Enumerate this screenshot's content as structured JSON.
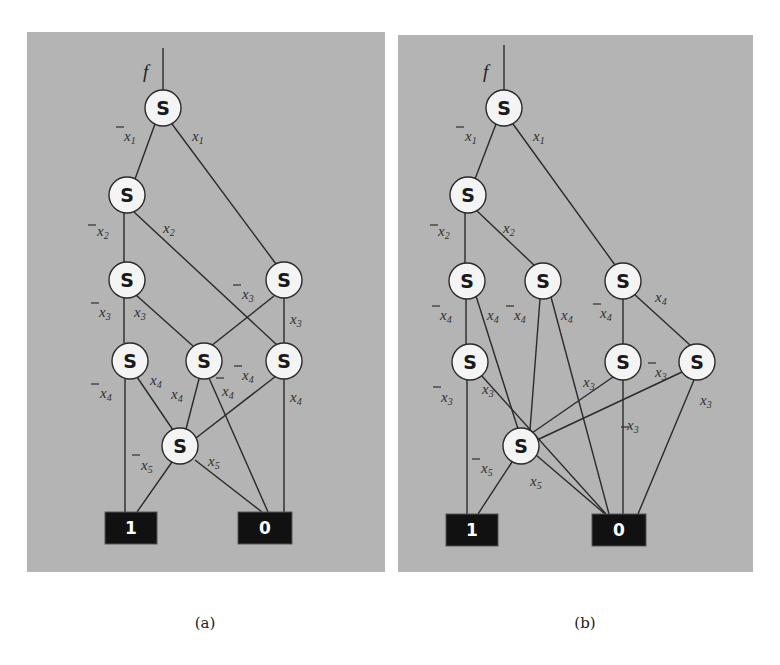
{
  "figure": {
    "node_symbol": "S",
    "root_label": "f",
    "terminal_labels": {
      "one": "1",
      "zero": "0"
    },
    "colors": {
      "panel_background": "#b4b4b4",
      "node_fill": "#f4f4f4",
      "terminal_fill": "#111111",
      "edge": "#2a2a2a"
    }
  },
  "panels": [
    {
      "caption": "(a)",
      "nodes": [
        {
          "id": "a1",
          "level": "x1",
          "label": "S"
        },
        {
          "id": "a2",
          "level": "x2",
          "label": "S"
        },
        {
          "id": "a3",
          "level": "x3",
          "label": "S"
        },
        {
          "id": "a4",
          "level": "x3",
          "label": "S"
        },
        {
          "id": "a5",
          "level": "x4",
          "label": "S"
        },
        {
          "id": "a6",
          "level": "x4",
          "label": "S"
        },
        {
          "id": "a7",
          "level": "x4",
          "label": "S"
        },
        {
          "id": "a8",
          "level": "x5",
          "label": "S"
        }
      ],
      "edges": [
        {
          "from": "a1",
          "to": "a2",
          "label": "x1",
          "negated": true
        },
        {
          "from": "a1",
          "to": "a4",
          "label": "x1",
          "negated": false
        },
        {
          "from": "a2",
          "to": "a3",
          "label": "x2",
          "negated": true
        },
        {
          "from": "a2",
          "to": "a7",
          "label": "x2",
          "negated": false
        },
        {
          "from": "a3",
          "to": "a5",
          "label": "x3",
          "negated": true
        },
        {
          "from": "a3",
          "to": "a6",
          "label": "x3",
          "negated": false
        },
        {
          "from": "a4",
          "to": "a6",
          "label": "x3",
          "negated": true
        },
        {
          "from": "a4",
          "to": "a7",
          "label": "x3",
          "negated": false
        },
        {
          "from": "a5",
          "to": "1",
          "label": "x4",
          "negated": true
        },
        {
          "from": "a5",
          "to": "a8",
          "label": "x4",
          "negated": false
        },
        {
          "from": "a6",
          "to": "a8",
          "label": "x4",
          "negated": false
        },
        {
          "from": "a6",
          "to": "0",
          "label": "x4",
          "negated": true
        },
        {
          "from": "a7",
          "to": "a8",
          "label": "x4",
          "negated": true
        },
        {
          "from": "a7",
          "to": "0",
          "label": "x4",
          "negated": false
        },
        {
          "from": "a8",
          "to": "1",
          "label": "x5",
          "negated": true
        },
        {
          "from": "a8",
          "to": "0",
          "label": "x5",
          "negated": false
        }
      ]
    },
    {
      "caption": "(b)",
      "nodes": [
        {
          "id": "b1",
          "level": "x1",
          "label": "S"
        },
        {
          "id": "b2",
          "level": "x2",
          "label": "S"
        },
        {
          "id": "b3",
          "level": "x4",
          "label": "S"
        },
        {
          "id": "b4",
          "level": "x4",
          "label": "S"
        },
        {
          "id": "b5",
          "level": "x4",
          "label": "S"
        },
        {
          "id": "b6",
          "level": "x3",
          "label": "S"
        },
        {
          "id": "b7",
          "level": "x3",
          "label": "S"
        },
        {
          "id": "b8",
          "level": "x3",
          "label": "S"
        },
        {
          "id": "b9",
          "level": "x5",
          "label": "S"
        }
      ],
      "edges": [
        {
          "from": "b1",
          "to": "b2",
          "label": "x1",
          "negated": true
        },
        {
          "from": "b1",
          "to": "b5",
          "label": "x1",
          "negated": false
        },
        {
          "from": "b2",
          "to": "b3",
          "label": "x2",
          "negated": true
        },
        {
          "from": "b2",
          "to": "b4",
          "label": "x2",
          "negated": false
        },
        {
          "from": "b3",
          "to": "b6",
          "label": "x4",
          "negated": true
        },
        {
          "from": "b3",
          "to": "b9",
          "label": "x4",
          "negated": false
        },
        {
          "from": "b4",
          "to": "b9",
          "label": "x4",
          "negated": true
        },
        {
          "from": "b4",
          "to": "0",
          "label": "x4",
          "negated": false
        },
        {
          "from": "b5",
          "to": "b7",
          "label": "x4",
          "negated": true
        },
        {
          "from": "b5",
          "to": "b8",
          "label": "x4",
          "negated": false
        },
        {
          "from": "b6",
          "to": "1",
          "label": "x3",
          "negated": true
        },
        {
          "from": "b6",
          "to": "0",
          "label": "x3",
          "negated": false
        },
        {
          "from": "b7",
          "to": "b9",
          "label": "x3",
          "negated": false
        },
        {
          "from": "b7",
          "to": "0",
          "label": "x3",
          "negated": true
        },
        {
          "from": "b8",
          "to": "b9",
          "label": "x3",
          "negated": true
        },
        {
          "from": "b8",
          "to": "0",
          "label": "x3",
          "negated": false
        },
        {
          "from": "b9",
          "to": "1",
          "label": "x5",
          "negated": true
        },
        {
          "from": "b9",
          "to": "0",
          "label": "x5",
          "negated": false
        }
      ]
    }
  ]
}
